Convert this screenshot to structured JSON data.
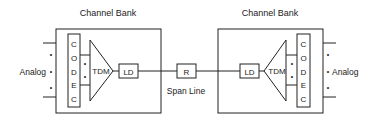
{
  "diagram": {
    "left_bank": {
      "title": "Channel Bank",
      "codec_letters": [
        "C",
        "O",
        "D",
        "E",
        "C"
      ],
      "mux_label": "TDM",
      "line_driver_label": "LD",
      "analog_label": "Analog",
      "dots": "•"
    },
    "span": {
      "repeater_label": "R",
      "label": "Span Line"
    },
    "right_bank": {
      "title": "Channel Bank",
      "codec_letters": [
        "C",
        "O",
        "D",
        "E",
        "C"
      ],
      "mux_label": "TDM",
      "line_driver_label": "LD",
      "analog_label": "Analog",
      "dots": "•"
    },
    "colors": {
      "stroke": "#222222",
      "background": "#ffffff"
    }
  }
}
